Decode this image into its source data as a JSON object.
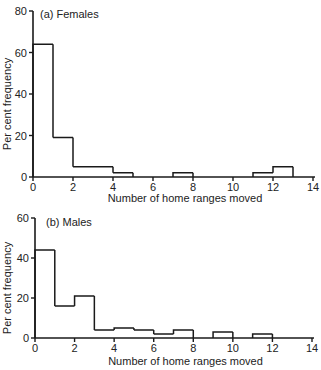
{
  "chart_data": [
    {
      "type": "bar",
      "subtype": "histogram",
      "title": "(a) Females",
      "xlabel": "Number of home ranges moved",
      "ylabel": "Per cent frequency",
      "xlim": [
        0,
        14
      ],
      "ylim": [
        0,
        80
      ],
      "xticks": [
        0,
        2,
        4,
        6,
        8,
        10,
        12,
        14
      ],
      "yticks": [
        0,
        20,
        40,
        60,
        80
      ],
      "grid": false,
      "bins": [
        {
          "x0": 0,
          "x1": 1,
          "value": 64
        },
        {
          "x0": 1,
          "x1": 2,
          "value": 19
        },
        {
          "x0": 2,
          "x1": 3,
          "value": 5
        },
        {
          "x0": 3,
          "x1": 4,
          "value": 5
        },
        {
          "x0": 4,
          "x1": 5,
          "value": 2
        },
        {
          "x0": 5,
          "x1": 6,
          "value": 0
        },
        {
          "x0": 6,
          "x1": 7,
          "value": 0
        },
        {
          "x0": 7,
          "x1": 8,
          "value": 2
        },
        {
          "x0": 8,
          "x1": 9,
          "value": 0
        },
        {
          "x0": 9,
          "x1": 10,
          "value": 0
        },
        {
          "x0": 10,
          "x1": 11,
          "value": 0
        },
        {
          "x0": 11,
          "x1": 12,
          "value": 2
        },
        {
          "x0": 12,
          "x1": 13,
          "value": 5
        },
        {
          "x0": 13,
          "x1": 14,
          "value": 0
        }
      ]
    },
    {
      "type": "bar",
      "subtype": "histogram",
      "title": "(b) Males",
      "xlabel": "Number of home ranges moved",
      "ylabel": "Per cent frequency",
      "xlim": [
        0,
        14
      ],
      "ylim": [
        0,
        60
      ],
      "xticks": [
        0,
        2,
        4,
        6,
        8,
        10,
        12,
        14
      ],
      "yticks": [
        0,
        20,
        40,
        60
      ],
      "grid": false,
      "bins": [
        {
          "x0": 0,
          "x1": 1,
          "value": 44
        },
        {
          "x0": 1,
          "x1": 2,
          "value": 16
        },
        {
          "x0": 2,
          "x1": 3,
          "value": 21
        },
        {
          "x0": 3,
          "x1": 4,
          "value": 4
        },
        {
          "x0": 4,
          "x1": 5,
          "value": 5
        },
        {
          "x0": 5,
          "x1": 6,
          "value": 4
        },
        {
          "x0": 6,
          "x1": 7,
          "value": 2
        },
        {
          "x0": 7,
          "x1": 8,
          "value": 4
        },
        {
          "x0": 8,
          "x1": 9,
          "value": 0
        },
        {
          "x0": 9,
          "x1": 10,
          "value": 3
        },
        {
          "x0": 10,
          "x1": 11,
          "value": 0
        },
        {
          "x0": 11,
          "x1": 12,
          "value": 2
        },
        {
          "x0": 12,
          "x1": 13,
          "value": 0
        },
        {
          "x0": 13,
          "x1": 14,
          "value": 0
        }
      ]
    }
  ],
  "panels": [
    {
      "title": "(a) Females",
      "xlabel": "Number of home ranges moved",
      "ylabel": "Per cent frequency"
    },
    {
      "title": "(b) Males",
      "xlabel": "Number of home ranges moved",
      "ylabel": "Per cent frequency"
    }
  ],
  "style": {
    "line_color": "#1a1a1a"
  }
}
